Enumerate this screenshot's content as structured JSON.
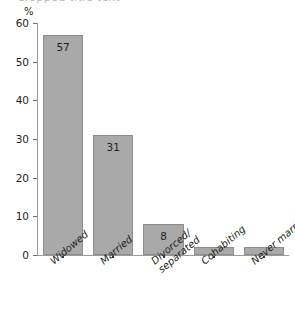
{
  "chart_data": {
    "type": "bar",
    "title": "",
    "xlabel": "",
    "ylabel": "%",
    "ylim": [
      0,
      60
    ],
    "yticks": [
      0,
      10,
      20,
      30,
      40,
      50,
      60
    ],
    "grid": false,
    "legend": null,
    "categories": [
      "Widowed",
      "Married",
      "Divorced/separated",
      "Cohabiting",
      "Never married"
    ],
    "category_lines": [
      [
        "Widowed"
      ],
      [
        "Married"
      ],
      [
        "Divorced/",
        "separated"
      ],
      [
        "Cohabiting"
      ],
      [
        "Never married"
      ]
    ],
    "values": [
      57,
      31,
      8,
      2,
      2
    ],
    "data_labels": [
      "57",
      "31",
      "8",
      "",
      ""
    ],
    "bar_color": "#a9a9a9",
    "bar_border_color": "#8e8e8e",
    "axis_color": "#9a9a9a",
    "text_color": "#231f20"
  },
  "axis": {
    "unit": "%",
    "tick_labels": [
      "60",
      "50",
      "40",
      "30",
      "20",
      "10",
      "0"
    ]
  },
  "title_remnant": "cropped title text"
}
